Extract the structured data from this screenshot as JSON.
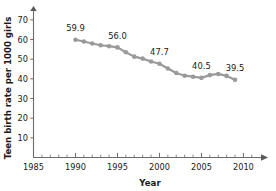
{
  "chart_data": {
    "type": "line",
    "title": "",
    "xlabel": "Year",
    "ylabel": "Teen birth rate per 1000 girls",
    "xlim": [
      1985,
      2011.5
    ],
    "ylim": [
      0,
      74
    ],
    "x_ticks": [
      1985,
      1990,
      1995,
      2000,
      2005,
      2010
    ],
    "x_tick_labels": [
      "1985",
      "1990",
      "1995",
      "2000",
      "2005",
      "2010"
    ],
    "x_minor_step": 1,
    "y_ticks": [
      10,
      20,
      30,
      40,
      50,
      60,
      70
    ],
    "y_tick_labels": [
      "10",
      "20",
      "30",
      "40",
      "50",
      "60",
      "70"
    ],
    "grid": false,
    "legend": "none",
    "series": [
      {
        "name": "Teen birth rate",
        "color": "#9a9a9a",
        "x": [
          1990,
          1991,
          1992,
          1993,
          1994,
          1995,
          1996,
          1997,
          1998,
          1999,
          2000,
          2001,
          2002,
          2003,
          2004,
          2005,
          2006,
          2007,
          2008,
          2009
        ],
        "values": [
          59.9,
          59.0,
          58.0,
          57.1,
          56.6,
          56.0,
          53.5,
          51.3,
          50.3,
          48.8,
          47.7,
          45.3,
          43.0,
          41.6,
          41.1,
          40.5,
          41.9,
          42.5,
          41.5,
          39.5
        ]
      }
    ],
    "point_labels": [
      {
        "x": 1990,
        "y": 59.9,
        "text": "59.9"
      },
      {
        "x": 1995,
        "y": 56.0,
        "text": "56.0"
      },
      {
        "x": 2000,
        "y": 47.7,
        "text": "47.7"
      },
      {
        "x": 2005,
        "y": 40.5,
        "text": "40.5"
      },
      {
        "x": 2009,
        "y": 39.5,
        "text": "39.5"
      }
    ]
  },
  "colors": {
    "series": "#9a9a9a",
    "axis": "#6b6b6b",
    "text": "#1a1a1a",
    "background": "#ffffff"
  }
}
